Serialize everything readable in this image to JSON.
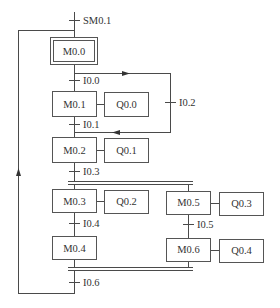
{
  "diagram": {
    "type": "sequential-function-chart",
    "initial_transition": "SM0.1",
    "steps": [
      {
        "id": "M0.0",
        "initial": true
      },
      {
        "id": "M0.1",
        "action": "Q0.0"
      },
      {
        "id": "M0.2",
        "action": "Q0.1"
      },
      {
        "id": "M0.3",
        "action": "Q0.2"
      },
      {
        "id": "M0.4"
      },
      {
        "id": "M0.5",
        "action": "Q0.3"
      },
      {
        "id": "M0.6",
        "action": "Q0.4"
      }
    ],
    "transitions": {
      "t_init": "SM0.1",
      "t0": "I0.0",
      "t1": "I0.1",
      "t2": "I0.2",
      "t3": "I0.3",
      "t4": "I0.4",
      "t5": "I0.5",
      "t6": "I0.6"
    },
    "labels": {
      "m00": "M0.0",
      "m01": "M0.1",
      "m02": "M0.2",
      "m03": "M0.3",
      "m04": "M0.4",
      "m05": "M0.5",
      "m06": "M0.6",
      "q00": "Q0.0",
      "q01": "Q0.1",
      "q02": "Q0.2",
      "q03": "Q0.3",
      "q04": "Q0.4"
    },
    "colors": {
      "line": "#4a4a4a",
      "text": "#333333",
      "background": "#ffffff"
    }
  }
}
